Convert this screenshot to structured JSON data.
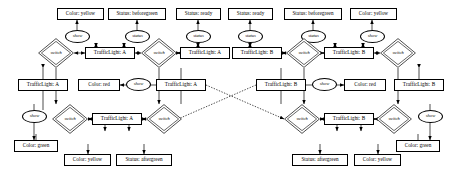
{
  "diagram": {
    "type": "entity-relationship",
    "stroke_color": "#000000",
    "background_color": "#ffffff",
    "nodes": [
      {
        "id": "v_color_yellow_tl",
        "kind": "value",
        "label": "Color: yellow",
        "x": 57,
        "y": 8,
        "w": 47,
        "h": 12
      },
      {
        "id": "v_status_beforegreen_tl",
        "kind": "value",
        "label": "Status: beforegreen",
        "x": 108,
        "y": 8,
        "w": 58,
        "h": 12
      },
      {
        "id": "v_status_ready_left",
        "kind": "value",
        "label": "Status: ready",
        "x": 176,
        "y": 8,
        "w": 45,
        "h": 12
      },
      {
        "id": "v_status_ready_right",
        "kind": "value",
        "label": "Status: ready",
        "x": 228,
        "y": 8,
        "w": 45,
        "h": 12
      },
      {
        "id": "v_status_beforegreen_tr",
        "kind": "value",
        "label": "Status: beforegreen",
        "x": 284,
        "y": 8,
        "w": 58,
        "h": 12
      },
      {
        "id": "v_color_yellow_tr",
        "kind": "value",
        "label": "Color: yellow",
        "x": 350,
        "y": 8,
        "w": 47,
        "h": 12
      },
      {
        "id": "a_show_t1",
        "kind": "attribute",
        "label": "show",
        "x": 65,
        "y": 30,
        "w": 25,
        "h": 13
      },
      {
        "id": "a_status_t1",
        "kind": "attribute",
        "label": "status",
        "x": 125,
        "y": 30,
        "w": 25,
        "h": 13
      },
      {
        "id": "a_status_t2",
        "kind": "attribute",
        "label": "status",
        "x": 186,
        "y": 30,
        "w": 25,
        "h": 13
      },
      {
        "id": "a_status_t3",
        "kind": "attribute",
        "label": "status",
        "x": 238,
        "y": 30,
        "w": 25,
        "h": 13
      },
      {
        "id": "a_status_t4",
        "kind": "attribute",
        "label": "status",
        "x": 301,
        "y": 30,
        "w": 25,
        "h": 13
      },
      {
        "id": "a_show_t2",
        "kind": "attribute",
        "label": "show",
        "x": 360,
        "y": 30,
        "w": 25,
        "h": 13
      },
      {
        "id": "r_switch_r2_l",
        "kind": "relationship",
        "label": "switch",
        "x": 38,
        "y": 38,
        "w": 36,
        "h": 30
      },
      {
        "id": "e_tl_a_r2",
        "kind": "entity",
        "label": "TrafficLight: A",
        "x": 85,
        "y": 47,
        "w": 50,
        "h": 12
      },
      {
        "id": "r_switch_r2_m",
        "kind": "relationship",
        "label": "switch",
        "x": 141,
        "y": 38,
        "w": 36,
        "h": 30
      },
      {
        "id": "e_tl_a_r2b",
        "kind": "entity",
        "label": "TrafficLight: A",
        "x": 180,
        "y": 47,
        "w": 50,
        "h": 12
      },
      {
        "id": "e_tl_b_r2",
        "kind": "entity",
        "label": "TrafficLight: B",
        "x": 232,
        "y": 47,
        "w": 50,
        "h": 12
      },
      {
        "id": "r_switch_r2_m2",
        "kind": "relationship",
        "label": "switch",
        "x": 286,
        "y": 38,
        "w": 36,
        "h": 30
      },
      {
        "id": "e_tl_b_r2b",
        "kind": "entity",
        "label": "TrafficLight: B",
        "x": 324,
        "y": 47,
        "w": 50,
        "h": 12
      },
      {
        "id": "r_switch_r2_r",
        "kind": "relationship",
        "label": "switch",
        "x": 380,
        "y": 38,
        "w": 36,
        "h": 30
      },
      {
        "id": "e_tl_a_r3",
        "kind": "entity",
        "label": "TrafficLight: A",
        "x": 18,
        "y": 79,
        "w": 50,
        "h": 12
      },
      {
        "id": "v_color_red_l",
        "kind": "value",
        "label": "Color: red",
        "x": 78,
        "y": 79,
        "w": 42,
        "h": 12
      },
      {
        "id": "a_show_r3l",
        "kind": "attribute",
        "label": "show",
        "x": 126,
        "y": 78,
        "w": 25,
        "h": 13
      },
      {
        "id": "e_tl_a_r3b",
        "kind": "entity",
        "label": "TrafficLight: A",
        "x": 156,
        "y": 79,
        "w": 50,
        "h": 12
      },
      {
        "id": "e_tl_b_r3",
        "kind": "entity",
        "label": "TrafficLight: B",
        "x": 256,
        "y": 79,
        "w": 50,
        "h": 12
      },
      {
        "id": "a_show_r3r",
        "kind": "attribute",
        "label": "show",
        "x": 312,
        "y": 78,
        "w": 25,
        "h": 13
      },
      {
        "id": "v_color_red_r",
        "kind": "value",
        "label": "Color: red",
        "x": 344,
        "y": 79,
        "w": 42,
        "h": 12
      },
      {
        "id": "e_tl_b_r3b",
        "kind": "entity",
        "label": "TrafficLight: B",
        "x": 394,
        "y": 79,
        "w": 50,
        "h": 12
      },
      {
        "id": "a_show_r4l",
        "kind": "attribute",
        "label": "show",
        "x": 22,
        "y": 110,
        "w": 25,
        "h": 13
      },
      {
        "id": "r_switch_r4_l",
        "kind": "relationship",
        "label": "switch",
        "x": 52,
        "y": 104,
        "w": 36,
        "h": 30
      },
      {
        "id": "e_tl_a_r4",
        "kind": "entity",
        "label": "TrafficLight: A",
        "x": 92,
        "y": 113,
        "w": 50,
        "h": 12
      },
      {
        "id": "r_switch_r4_m",
        "kind": "relationship",
        "label": "switch",
        "x": 146,
        "y": 104,
        "w": 36,
        "h": 30
      },
      {
        "id": "r_switch_r4_m2",
        "kind": "relationship",
        "label": "switch",
        "x": 284,
        "y": 104,
        "w": 36,
        "h": 30
      },
      {
        "id": "e_tl_b_r4",
        "kind": "entity",
        "label": "TrafficLight: B",
        "x": 324,
        "y": 113,
        "w": 50,
        "h": 12
      },
      {
        "id": "r_switch_r4_r",
        "kind": "relationship",
        "label": "switch",
        "x": 376,
        "y": 104,
        "w": 36,
        "h": 30
      },
      {
        "id": "a_show_r4r",
        "kind": "attribute",
        "label": "show",
        "x": 418,
        "y": 110,
        "w": 25,
        "h": 13
      },
      {
        "id": "v_color_green_bl",
        "kind": "value",
        "label": "Color: green",
        "x": 14,
        "y": 140,
        "w": 44,
        "h": 12
      },
      {
        "id": "v_color_yellow_bl",
        "kind": "value",
        "label": "Color: yellow",
        "x": 64,
        "y": 154,
        "w": 47,
        "h": 12
      },
      {
        "id": "v_status_aftergreen_bl",
        "kind": "value",
        "label": "Status: aftergreen",
        "x": 116,
        "y": 154,
        "w": 56,
        "h": 12
      },
      {
        "id": "v_status_aftergreen_br",
        "kind": "value",
        "label": "Status: aftergreen",
        "x": 292,
        "y": 154,
        "w": 56,
        "h": 12
      },
      {
        "id": "v_color_yellow_br",
        "kind": "value",
        "label": "Color: yellow",
        "x": 354,
        "y": 154,
        "w": 47,
        "h": 12
      },
      {
        "id": "v_color_green_br",
        "kind": "value",
        "label": "Color: green",
        "x": 396,
        "y": 140,
        "w": 44,
        "h": 12
      }
    ],
    "edges": [
      {
        "from": "e_tl_a_r2",
        "to": "a_show_t1",
        "style": "solid",
        "arrow": "both"
      },
      {
        "from": "e_tl_a_r2",
        "to": "a_status_t1",
        "style": "solid",
        "arrow": "both"
      },
      {
        "from": "a_show_t1",
        "to": "v_color_yellow_tl",
        "style": "solid",
        "arrow": "end"
      },
      {
        "from": "a_status_t1",
        "to": "v_status_beforegreen_tl",
        "style": "solid",
        "arrow": "end"
      },
      {
        "from": "a_status_t2",
        "to": "v_status_ready_left",
        "style": "solid",
        "arrow": "end"
      },
      {
        "from": "a_status_t3",
        "to": "v_status_ready_right",
        "style": "solid",
        "arrow": "end"
      },
      {
        "from": "a_status_t4",
        "to": "v_status_beforegreen_tr",
        "style": "solid",
        "arrow": "end"
      },
      {
        "from": "a_show_t2",
        "to": "v_color_yellow_tr",
        "style": "solid",
        "arrow": "end"
      },
      {
        "from": "r_switch_r2_l",
        "to": "e_tl_a_r2",
        "style": "solid",
        "arrow": "end"
      },
      {
        "from": "r_switch_r2_m",
        "to": "e_tl_a_r2b",
        "style": "solid",
        "arrow": "end"
      },
      {
        "from": "r_switch_r2_m2",
        "to": "e_tl_b_r2b",
        "style": "solid",
        "arrow": "end"
      },
      {
        "from": "a_show_r3l",
        "to": "v_color_red_l",
        "style": "solid",
        "arrow": "end"
      },
      {
        "from": "a_show_r3r",
        "to": "v_color_red_r",
        "style": "solid",
        "arrow": "end"
      },
      {
        "from": "r_switch_r4_l",
        "to": "e_tl_a_r4",
        "style": "solid",
        "arrow": "end"
      },
      {
        "from": "r_switch_r4_m2",
        "to": "e_tl_b_r4",
        "style": "solid",
        "arrow": "end"
      },
      {
        "from": "e_tl_a_r3b",
        "to": "e_tl_b_r4",
        "style": "dotted",
        "arrow": "end"
      },
      {
        "from": "e_tl_b_r3",
        "to": "e_tl_a_r4",
        "style": "dotted",
        "arrow": "end"
      }
    ]
  }
}
